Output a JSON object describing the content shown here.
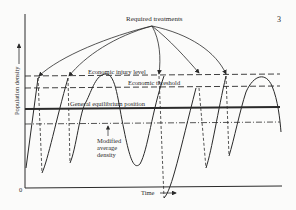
{
  "page_number": "3",
  "diagram": {
    "title_annotation": "Required treatments",
    "y_axis_label": "Population density",
    "x_axis_label": "Time",
    "origin_label": "0",
    "levels": {
      "injury": "Economic injury level",
      "threshold": "Economic threshold",
      "equilibrium": "General equilibrium position",
      "modified": "Modified average density"
    },
    "modified_lines": [
      "Modified",
      "average",
      "density"
    ]
  }
}
